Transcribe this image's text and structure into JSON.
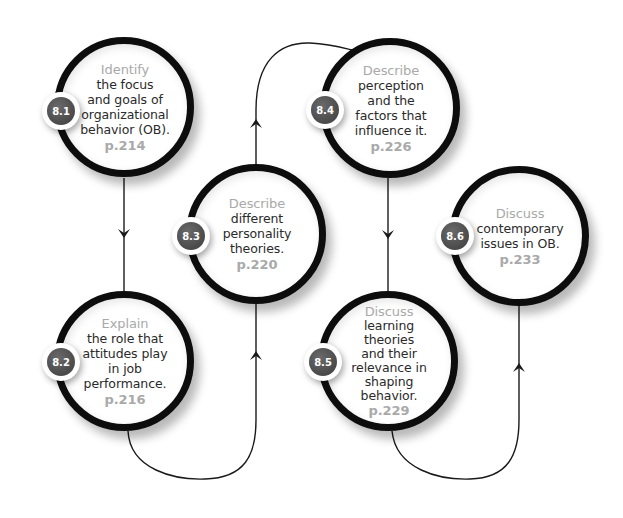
{
  "diagram": {
    "type": "learning-objectives-flow",
    "colors": {
      "ring": "#0d0d0d",
      "verb_text": "#a9a9a9",
      "body_text": "#2a2a2a",
      "badge_fill": "#555555",
      "connector": "#1a1a1a"
    },
    "nodes": [
      {
        "id": "8.1",
        "badge": "8.1",
        "verb": "Identify",
        "text": "the focus\nand goals of\norganizational\nbehavior (OB).",
        "page": "p.214"
      },
      {
        "id": "8.2",
        "badge": "8.2",
        "verb": "Explain",
        "text": "the role that\nattitudes play\nin job\nperformance.",
        "page": "p.216"
      },
      {
        "id": "8.3",
        "badge": "8.3",
        "verb": "Describe",
        "text": "different\npersonality\ntheories.",
        "page": "p.220"
      },
      {
        "id": "8.4",
        "badge": "8.4",
        "verb": "Describe",
        "text": "perception\nand the\nfactors that\ninfluence it.",
        "page": "p.226"
      },
      {
        "id": "8.5",
        "badge": "8.5",
        "verb": "Discuss",
        "text": "learning\ntheories\nand their\nrelevance in\nshaping\nbehavior.",
        "page": "p.229"
      },
      {
        "id": "8.6",
        "badge": "8.6",
        "verb": "Discuss",
        "text": "contemporary\nissues in OB.",
        "page": "p.233"
      }
    ],
    "edges": [
      {
        "from": "8.1",
        "to": "8.2",
        "direction": "down"
      },
      {
        "from": "8.2",
        "to": "8.3",
        "direction": "up"
      },
      {
        "from": "8.3",
        "to": "8.4",
        "direction": "up"
      },
      {
        "from": "8.4",
        "to": "8.5",
        "direction": "down"
      },
      {
        "from": "8.5",
        "to": "8.6",
        "direction": "up"
      }
    ]
  }
}
